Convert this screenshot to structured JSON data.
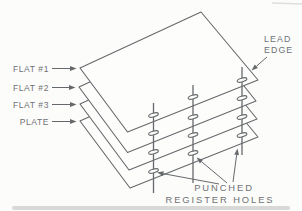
{
  "figure": {
    "width": 302,
    "height": 211,
    "background": "#fcfcfb",
    "line_color": "#66696c",
    "text_color": "#6e7174",
    "sheet_fill": "#fdfdfc",
    "scan_strip_color": "#cecece",
    "scan_line_color": "#dcdcdc"
  },
  "diagram": {
    "type": "exploded-stack-diagram",
    "sheets": [
      {
        "id": "flat-1",
        "label": "FLAT #1",
        "corners": {
          "left": [
            80,
            68
          ],
          "top": [
            201,
            12
          ],
          "right": [
            258,
            80
          ],
          "bottom": [
            127.5,
            132
          ]
        }
      },
      {
        "id": "flat-2",
        "label": "FLAT #2",
        "corners": {
          "left": [
            79,
            87
          ],
          "top": [
            200,
            31
          ],
          "right": [
            256,
            101
          ],
          "bottom": [
            127.5,
            152.5
          ]
        }
      },
      {
        "id": "flat-3",
        "label": "FLAT #3",
        "corners": {
          "left": [
            80,
            104
          ],
          "top": [
            200,
            49
          ],
          "right": [
            257,
            119
          ],
          "bottom": [
            129,
            170
          ]
        }
      },
      {
        "id": "plate",
        "label": "PLATE",
        "corners": {
          "left": [
            80,
            121
          ],
          "top": [
            200,
            67
          ],
          "right": [
            258,
            137
          ],
          "bottom": [
            130,
            188
          ]
        }
      }
    ],
    "pins": [
      {
        "id": "pin-left",
        "x": 153.5,
        "top": 103,
        "bottom": 193,
        "holes": [
          115,
          133,
          152,
          171
        ]
      },
      {
        "id": "pin-middle",
        "x": 193,
        "top": 85,
        "bottom": 183,
        "holes": [
          97,
          117,
          135,
          153
        ]
      },
      {
        "id": "pin-right",
        "x": 242,
        "top": 67,
        "bottom": 155,
        "holes": [
          80,
          98,
          117,
          135
        ]
      }
    ],
    "hole_style": {
      "rx": 5,
      "ry": 1.9,
      "rotation": -15
    },
    "sheet_label_layout": {
      "align_x": 49,
      "arrow_start_x": 52
    },
    "callouts": {
      "lead_edge": {
        "lines": [
          "LEAD",
          "EDGE"
        ],
        "x": 264,
        "baselines": [
          42,
          53
        ],
        "arrow": {
          "from": [
            267,
            57
          ],
          "to": [
            251.5,
            70.5
          ]
        }
      },
      "register_holes": {
        "lines": [
          "PUNCHED",
          "REGISTER HOLES"
        ],
        "centers": [
          [
            224,
            191
          ],
          [
            220,
            203
          ]
        ],
        "arrows": [
          {
            "from": [
              219,
              184
            ],
            "to": [
              157,
              172.5
            ]
          },
          {
            "from": [
              227,
              183
            ],
            "to": [
              196.5,
              157.5
            ]
          },
          {
            "from": [
              233,
              182
            ],
            "to": [
              237.5,
              148.5
            ]
          }
        ]
      }
    }
  }
}
